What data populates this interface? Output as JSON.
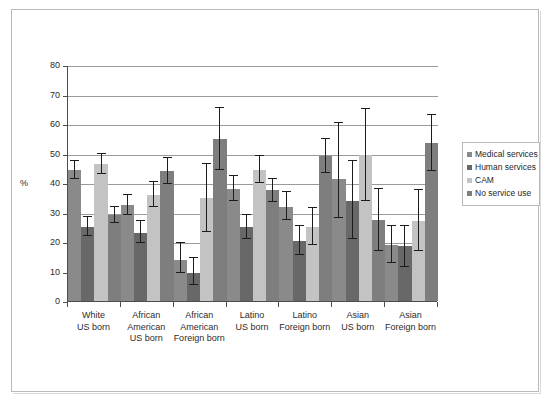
{
  "chart_data": {
    "type": "bar",
    "title": "",
    "subtitle": "",
    "xlabel": "",
    "ylabel": "%",
    "ylim": [
      0,
      80
    ],
    "yticks": [
      0,
      10,
      20,
      30,
      40,
      50,
      60,
      70,
      80
    ],
    "ytick_labels": [
      "0",
      "10",
      "20",
      "30",
      "40",
      "50",
      "60",
      "70",
      "80"
    ],
    "grid": "horizontal",
    "legend_position": "right",
    "error_bars": "95% CI",
    "categories": [
      "White\nUS born",
      "African\nAmerican\nUS born",
      "African\nAmerican\nForeign born",
      "Latino\nUS born",
      "Latino\nForeign born",
      "Asian\nUS born",
      "Asian\nForeign born"
    ],
    "category_lines": [
      [
        "White",
        "US born"
      ],
      [
        "African",
        "American",
        "US born"
      ],
      [
        "African",
        "American",
        "Foreign born"
      ],
      [
        "Latino",
        "US born"
      ],
      [
        "Latino",
        "Foreign born"
      ],
      [
        "Asian",
        "US born"
      ],
      [
        "Asian",
        "Foreign born"
      ]
    ],
    "series": [
      {
        "name": "Medical services",
        "color": "#8a8a8a",
        "values": [
          44.5,
          32.5,
          14.0,
          38.0,
          32.0,
          41.5,
          19.0
        ],
        "err_low": [
          41.5,
          29.0,
          9.5,
          34.0,
          27.5,
          28.0,
          13.0
        ],
        "err_high": [
          47.5,
          36.0,
          19.5,
          42.5,
          37.0,
          60.5,
          25.5
        ]
      },
      {
        "name": "Human services",
        "color": "#686868",
        "values": [
          25.0,
          23.0,
          9.5,
          25.0,
          20.5,
          34.0,
          18.5
        ],
        "err_low": [
          22.0,
          19.5,
          5.5,
          21.0,
          15.5,
          21.0,
          11.5
        ],
        "err_high": [
          28.5,
          27.0,
          14.5,
          29.0,
          25.5,
          47.5,
          25.5
        ]
      },
      {
        "name": "CAM",
        "color": "#c3c3c3",
        "values": [
          46.5,
          36.0,
          35.0,
          44.5,
          25.0,
          49.5,
          27.0
        ],
        "err_low": [
          43.0,
          32.0,
          23.5,
          40.0,
          19.0,
          34.0,
          17.0
        ],
        "err_high": [
          50.0,
          40.5,
          46.5,
          49.0,
          31.5,
          65.0,
          37.5
        ]
      },
      {
        "name": "No service use",
        "color": "#7e7e7e",
        "values": [
          29.0,
          44.0,
          55.0,
          37.5,
          49.0,
          27.5,
          53.5
        ],
        "err_low": [
          26.5,
          39.5,
          44.5,
          33.5,
          43.5,
          17.0,
          44.0
        ],
        "err_high": [
          32.0,
          48.5,
          65.5,
          41.5,
          55.0,
          38.0,
          63.0
        ]
      }
    ]
  },
  "legend": {
    "items": [
      {
        "label": "Medical services",
        "color": "#8a8a8a"
      },
      {
        "label": "Human services",
        "color": "#686868"
      },
      {
        "label": "CAM",
        "color": "#c3c3c3"
      },
      {
        "label": "No service use",
        "color": "#7e7e7e"
      }
    ]
  },
  "axis": {
    "ylabel": "%",
    "ytick_labels": [
      "0",
      "10",
      "20",
      "30",
      "40",
      "50",
      "60",
      "70",
      "80"
    ]
  }
}
